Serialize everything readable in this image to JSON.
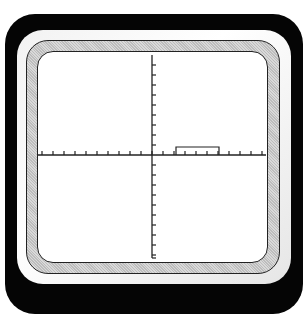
{
  "display": {
    "type": "oscilloscope-screen",
    "colors": {
      "bezel": "#050505",
      "bevel": "#f2f2f2",
      "ring": "#bdbdbd",
      "screen": "#ffffff",
      "trace": "#222222"
    }
  },
  "graticule": {
    "x_axis": {
      "y": 155,
      "x_start": 38,
      "x_end": 266,
      "tick_spacing": 11
    },
    "y_axis": {
      "x": 152,
      "y_start": 55,
      "y_end": 258,
      "tick_spacing": 10
    }
  },
  "trace": {
    "shape": "rectangular-pulse",
    "x_start": 176,
    "x_end": 219,
    "top_y": 147,
    "baseline_y": 155
  }
}
